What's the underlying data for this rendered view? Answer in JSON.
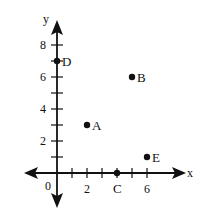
{
  "chart_data": {
    "type": "scatter",
    "title": "",
    "xlabel": "x",
    "ylabel": "y",
    "origin_label": "0",
    "x_ticks": [
      1,
      2,
      3,
      4,
      5,
      6
    ],
    "x_tick_labels": [
      {
        "value": 2,
        "label": "2"
      },
      {
        "value": 6,
        "label": "6"
      }
    ],
    "y_ticks": [
      1,
      2,
      3,
      4,
      5,
      6,
      7,
      8
    ],
    "y_tick_labels": [
      {
        "value": 2,
        "label": "2"
      },
      {
        "value": 4,
        "label": "4"
      },
      {
        "value": 6,
        "label": "6"
      },
      {
        "value": 8,
        "label": "8"
      }
    ],
    "points": [
      {
        "label": "A",
        "x": 2,
        "y": 3
      },
      {
        "label": "B",
        "x": 5,
        "y": 6
      },
      {
        "label": "C",
        "x": 4,
        "y": 0
      },
      {
        "label": "D",
        "x": 0,
        "y": 7
      },
      {
        "label": "E",
        "x": 6,
        "y": 1
      }
    ],
    "grid": false,
    "legend": "none"
  },
  "axes": {
    "x_label": "x",
    "y_label": "y",
    "origin": "0"
  }
}
